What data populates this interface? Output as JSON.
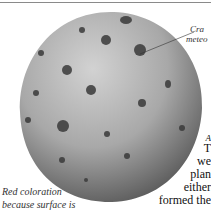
{
  "illustration": {
    "subject": "cratered-sphere",
    "colors": {
      "sphere_light": "#c9c9c9",
      "sphere_mid": "#9a9a9a",
      "sphere_dark": "#4a4a4a",
      "crater": "#3a3a3a"
    }
  },
  "annotations": {
    "crater_label_line1": "Cra",
    "crater_label_line2": "meteo",
    "coloration_line1": "Red coloration",
    "coloration_line2": "because surface is"
  },
  "body_text": {
    "line0": "A",
    "line1": "T",
    "line2": "we",
    "line3": "plan",
    "line4": "either",
    "line5": "formed the"
  }
}
